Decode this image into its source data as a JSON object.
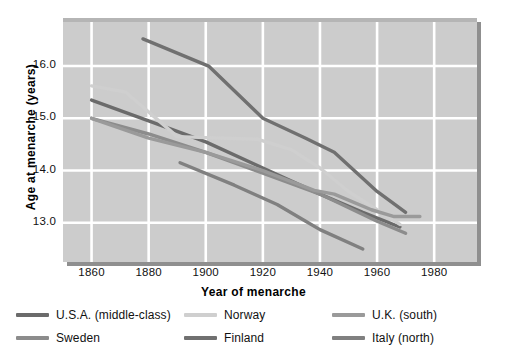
{
  "chart_data": {
    "type": "line",
    "title": "",
    "xlabel": "Year of menarche",
    "ylabel": "Age at menarche (years)",
    "xlim": [
      1850,
      1995
    ],
    "ylim": [
      12.25,
      16.92
    ],
    "xticks": [
      1860,
      1880,
      1900,
      1920,
      1940,
      1960,
      1980
    ],
    "xtick_labels": [
      "1860",
      "1880",
      "1900",
      "1920",
      "1940",
      "1960",
      "1980"
    ],
    "yticks": [
      13.0,
      14.0,
      15.0,
      16.0
    ],
    "ytick_labels": [
      "13.0",
      "14.0",
      "15.0",
      "16.0"
    ],
    "grid": true,
    "grid_color": "#ffffff",
    "plot_background": "#cccccc",
    "legend_position": "below",
    "series": [
      {
        "name": "U.S.A. (middle-class)",
        "color": "#6b6b6b",
        "x": [
          1860,
          1880,
          1900,
          1920,
          1940,
          1955,
          1968
        ],
        "y": [
          15.35,
          14.95,
          14.55,
          14.05,
          13.55,
          13.2,
          12.92
        ]
      },
      {
        "name": "Sweden",
        "color": "#8c8c8c",
        "x": [
          1860,
          1880,
          1900,
          1920,
          1940,
          1960,
          1970
        ],
        "y": [
          15.0,
          14.7,
          14.35,
          13.95,
          13.55,
          13.03,
          12.8
        ]
      },
      {
        "name": "Norway",
        "color": "#cfcfcf",
        "x": [
          1860,
          1872,
          1890,
          1900,
          1918,
          1930,
          1940,
          1950,
          1960,
          1968
        ],
        "y": [
          15.62,
          15.5,
          14.65,
          14.63,
          14.6,
          14.4,
          14.05,
          13.6,
          13.25,
          12.97
        ]
      },
      {
        "name": "Finland",
        "color": "#707070",
        "x": [
          1878,
          1901,
          1920,
          1935,
          1945,
          1960,
          1970
        ],
        "y": [
          16.52,
          16.0,
          15.0,
          14.62,
          14.35,
          13.6,
          13.2
        ]
      },
      {
        "name": "U.K. (south)",
        "color": "#9a9a9a",
        "x": [
          1860,
          1880,
          1900,
          1920,
          1938,
          1945,
          1958,
          1966,
          1975
        ],
        "y": [
          15.0,
          14.62,
          14.35,
          14.0,
          13.62,
          13.55,
          13.25,
          13.12,
          13.12
        ]
      },
      {
        "name": "Italy (north)",
        "color": "#808080",
        "x": [
          1891,
          1910,
          1925,
          1935,
          1940,
          1955
        ],
        "y": [
          14.15,
          13.72,
          13.35,
          13.03,
          12.87,
          12.5
        ]
      }
    ]
  },
  "legend": {
    "entries": [
      {
        "label": "U.S.A. (middle-class)",
        "color": "#6b6b6b"
      },
      {
        "label": "Norway",
        "color": "#cfcfcf"
      },
      {
        "label": "U.K. (south)",
        "color": "#9a9a9a"
      },
      {
        "label": "Sweden",
        "color": "#8c8c8c"
      },
      {
        "label": "Finland",
        "color": "#707070"
      },
      {
        "label": "Italy (north)",
        "color": "#808080"
      }
    ]
  }
}
